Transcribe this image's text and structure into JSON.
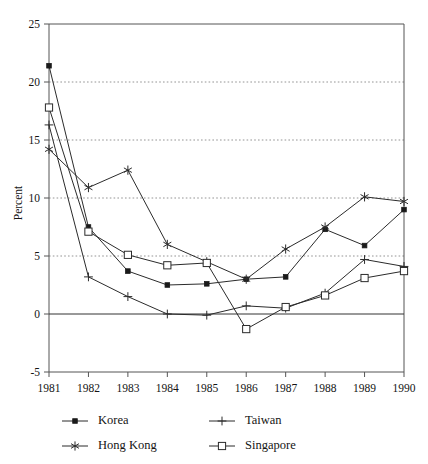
{
  "chart_data": {
    "type": "line",
    "title": "",
    "xlabel": "",
    "ylabel": "Percent",
    "x": [
      1981,
      1982,
      1983,
      1984,
      1985,
      1986,
      1987,
      1988,
      1989,
      1990
    ],
    "xtick_labels": [
      "1981",
      "1982",
      "1983",
      "1984",
      "1985",
      "1986",
      "1987",
      "1988",
      "1989",
      "1990"
    ],
    "ytick_labels": [
      "25",
      "20",
      "15",
      "10",
      "5",
      "0",
      "-5"
    ],
    "yticks": [
      25,
      20,
      15,
      10,
      5,
      0,
      -5
    ],
    "ylim": [
      -5,
      25
    ],
    "xlim": [
      1981,
      1990
    ],
    "grid": "horizontal dotted gridlines at 5, 10, 15, 20; solid line at 0",
    "legend_position": "below-plot",
    "series": [
      {
        "name": "Korea",
        "marker": "filled-square",
        "values": [
          21.4,
          7.5,
          3.7,
          2.5,
          2.6,
          3.0,
          3.2,
          7.3,
          5.9,
          9.0
        ]
      },
      {
        "name": "Taiwan",
        "marker": "plus",
        "values": [
          16.3,
          3.2,
          1.5,
          0.0,
          -0.1,
          0.7,
          0.5,
          1.8,
          4.7,
          4.1
        ]
      },
      {
        "name": "Hong Kong",
        "marker": "asterisk",
        "values": [
          14.2,
          10.9,
          12.4,
          6.0,
          4.5,
          3.0,
          5.6,
          7.5,
          10.1,
          9.7
        ]
      },
      {
        "name": "Singapore",
        "marker": "open-square",
        "values": [
          17.8,
          7.1,
          5.1,
          4.2,
          4.4,
          -1.3,
          0.6,
          1.6,
          3.1,
          3.7
        ]
      }
    ],
    "colors": {
      "line": "#2b2b2b",
      "grid": "#888888",
      "axis": "#555555",
      "text": "#141414",
      "background": "#ffffff"
    }
  }
}
